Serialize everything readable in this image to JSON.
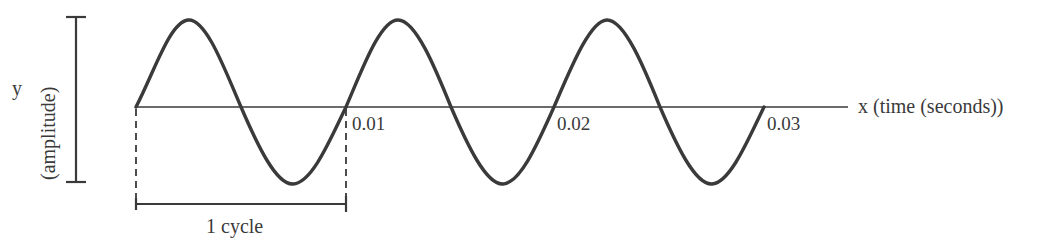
{
  "diagram": {
    "type": "sine-wave",
    "title": "",
    "y_axis": {
      "symbol": "y",
      "label": "(amplitude)"
    },
    "x_axis": {
      "label": "x (time (seconds))",
      "ticks": [
        "0.01",
        "0.02",
        "0.03"
      ]
    },
    "annotation": {
      "cycle_label": "1 cycle"
    },
    "cycles_shown": 3,
    "period_seconds": 0.01,
    "colors": {
      "stroke": "#3a3a3a",
      "background": "#ffffff"
    }
  }
}
